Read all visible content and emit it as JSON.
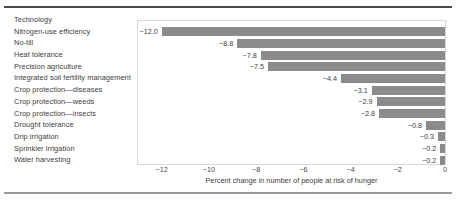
{
  "chart_data": {
    "type": "bar",
    "orientation": "horizontal",
    "title": "",
    "xlabel": "Percent change in number of people at risk of hunger",
    "ylabel": "Technology",
    "xlim": [
      -13,
      0
    ],
    "xticks": [
      -12,
      -10,
      -8,
      -6,
      -4,
      -2,
      0
    ],
    "xticklabels": [
      "−12",
      "−10",
      "−8",
      "−6",
      "−4",
      "−2",
      "0"
    ],
    "grid": false,
    "legend": null,
    "bar_color": "#8b8b8b",
    "categories": [
      "Nitrogen-use efficiency",
      "No-till",
      "Heat tolerance",
      "Precision agriculture",
      "Integrated soil fertility management",
      "Crop protection—diseases",
      "Crop protection—weeds",
      "Crop protection—insects",
      "Drought tolerance",
      "Drip irrigation",
      "Sprinkler irrigation",
      "Water harvesting"
    ],
    "values": [
      -12.0,
      -8.8,
      -7.8,
      -7.5,
      -4.4,
      -3.1,
      -2.9,
      -2.8,
      -0.8,
      -0.3,
      -0.2,
      -0.2
    ],
    "datalabels": [
      "−12.0",
      "−8.8",
      "−7.8",
      "−7.5",
      "−4.4",
      "−3.1",
      "−2.9",
      "−2.8",
      "−0.8",
      "−0.3",
      "−0.2",
      "−0.2"
    ]
  },
  "labels_column": {
    "header": "Technology",
    "items": [
      "Nitrogen-use efficiency",
      "No-till",
      "Heat tolerance",
      "Precision agriculture",
      "Integrated soil fertility management",
      "Crop protection—diseases",
      "Crop protection—weeds",
      "Crop protection—insects",
      "Drought tolerance",
      "Drip irrigation",
      "Sprinkler irrigation",
      "Water harvesting"
    ]
  }
}
